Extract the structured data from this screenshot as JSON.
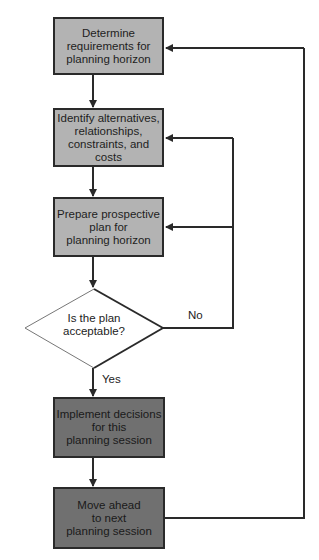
{
  "diagram": {
    "type": "flowchart",
    "nodes": [
      {
        "id": "n1",
        "kind": "process",
        "shade": "light",
        "text": "Determine\nrequirements for\nplanning horizon"
      },
      {
        "id": "n2",
        "kind": "process",
        "shade": "light",
        "text": "Identify alternatives,\nrelationships,\nconstraints, and costs"
      },
      {
        "id": "n3",
        "kind": "process",
        "shade": "light",
        "text": "Prepare prospective\nplan for\nplanning horizon"
      },
      {
        "id": "n4",
        "kind": "decision",
        "text": "Is the plan\nacceptable?"
      },
      {
        "id": "n5",
        "kind": "process",
        "shade": "dark",
        "text": "Implement decisions\nfor this\nplanning session"
      },
      {
        "id": "n6",
        "kind": "process",
        "shade": "dark",
        "text": "Move ahead\nto next\nplanning session"
      }
    ],
    "edges": [
      {
        "from": "n1",
        "to": "n2"
      },
      {
        "from": "n2",
        "to": "n3"
      },
      {
        "from": "n3",
        "to": "n4"
      },
      {
        "from": "n4",
        "to": "n5",
        "label": "Yes"
      },
      {
        "from": "n4",
        "to": "n3",
        "label": "No"
      },
      {
        "from": "n4",
        "to": "n2",
        "label": "No"
      },
      {
        "from": "n5",
        "to": "n6"
      },
      {
        "from": "n6",
        "to": "n1"
      }
    ],
    "labels": {
      "yes": "Yes",
      "no": "No"
    },
    "colors": {
      "light_fill": "#b3b3b3",
      "dark_fill": "#707070",
      "stroke": "#2a2a2a"
    }
  }
}
